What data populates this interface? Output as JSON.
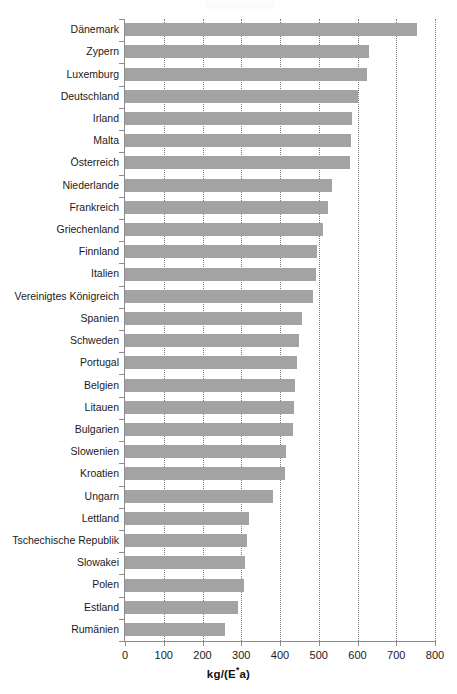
{
  "chart_data": {
    "type": "bar",
    "orientation": "horizontal",
    "title": "",
    "xlabel": "kg/(E*a)",
    "xlabel_parts": {
      "before": "kg/(E",
      "sup": "*",
      "after": "a)"
    },
    "ylabel": "",
    "xlim": [
      0,
      800
    ],
    "xticks": [
      0,
      100,
      200,
      300,
      400,
      500,
      600,
      700,
      800
    ],
    "xtick_labels": [
      "0",
      "100",
      "200",
      "300",
      "400",
      "500",
      "600",
      "700",
      "800"
    ],
    "grid": "vertical-dotted",
    "legend": "none",
    "bar_color": "#a3a3a3",
    "categories": [
      "Dänemark",
      "Zypern",
      "Luxemburg",
      "Deutschland",
      "Irland",
      "Malta",
      "Österreich",
      "Niederlande",
      "Frankreich",
      "Griechenland",
      "Finnland",
      "Italien",
      "Vereinigtes Königreich",
      "Spanien",
      "Schweden",
      "Portugal",
      "Belgien",
      "Litauen",
      "Bulgarien",
      "Slowenien",
      "Kroatien",
      "Ungarn",
      "Lettland",
      "Tschechische Republik",
      "Slowakei",
      "Polen",
      "Estland",
      "Rumänien"
    ],
    "values": [
      754,
      630,
      624,
      600,
      585,
      583,
      581,
      534,
      524,
      511,
      496,
      493,
      485,
      457,
      449,
      444,
      439,
      435,
      433,
      416,
      414,
      382,
      320,
      315,
      310,
      307,
      292,
      258
    ]
  }
}
